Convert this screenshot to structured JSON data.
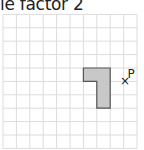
{
  "title_visible": "ale factor 2",
  "grid": {
    "origin_x": 3,
    "origin_y": 14.4,
    "cell": 13.4,
    "cols": 10,
    "rows": 10,
    "line_color": "#dcdcdc"
  },
  "shape": {
    "cells": [
      [
        6,
        4
      ],
      [
        7,
        4
      ],
      [
        7,
        5
      ],
      [
        7,
        6
      ]
    ],
    "fill": "#c8c8c8",
    "stroke": "#555555"
  },
  "point": {
    "label": "P",
    "marker": "×",
    "grid_x": 9,
    "grid_y": 5
  }
}
